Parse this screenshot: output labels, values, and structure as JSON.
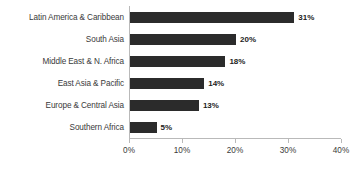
{
  "chart_data": {
    "type": "bar",
    "orientation": "horizontal",
    "title": "",
    "xlabel": "",
    "ylabel": "",
    "categories": [
      "Latin America & Caribbean",
      "South Asia",
      "Middle East & N. Africa",
      "East Asia & Pacific",
      "Europe & Central Asia",
      "Southern Africa"
    ],
    "values": [
      31,
      20,
      18,
      14,
      13,
      5
    ],
    "value_labels": [
      "31%",
      "20%",
      "18%",
      "14%",
      "13%",
      "5%"
    ],
    "xlim": [
      0,
      40
    ],
    "xticks": [
      0,
      10,
      20,
      30,
      40
    ],
    "xtick_labels": [
      "0%",
      "10%",
      "20%",
      "30%",
      "40%"
    ],
    "grid": false,
    "legend": null,
    "bar_color": "#2b2b2b",
    "axis_color": "#b9b9b9",
    "background_color": "#ffffff"
  }
}
